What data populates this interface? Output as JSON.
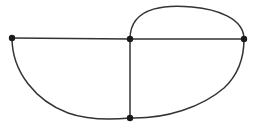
{
  "figure": {
    "background_color": "#ffffff",
    "edge_color": "#333333",
    "vertex_color": "#1a1a1a",
    "edge_stroke_width": 1.5,
    "vertex_radius": 3.2,
    "canvas": {
      "width": 254,
      "height": 126
    },
    "vertices": [
      {
        "id": "v-left",
        "label": "",
        "x": 12,
        "y": 38
      },
      {
        "id": "v-center",
        "label": "",
        "x": 130,
        "y": 39
      },
      {
        "id": "v-right",
        "label": "",
        "x": 244,
        "y": 39
      },
      {
        "id": "v-bottom",
        "label": "",
        "x": 130,
        "y": 118
      }
    ],
    "edges": [
      {
        "id": "edge-left-center-straight",
        "from": "v-left",
        "to": "v-center",
        "shape": "straight",
        "path": "M 12 38 L 130 39"
      },
      {
        "id": "edge-center-right-straight",
        "from": "v-center",
        "to": "v-right",
        "shape": "straight",
        "path": "M 130 39 L 244 39"
      },
      {
        "id": "edge-center-bottom-straight",
        "from": "v-center",
        "to": "v-bottom",
        "shape": "straight",
        "path": "M 130 39 L 130 118"
      },
      {
        "id": "edge-center-right-arc-top",
        "from": "v-center",
        "to": "v-right",
        "shape": "arc-above",
        "path": "M 130 39 C 130 4 172 5 192 7 C 216 9 244 18 244 39"
      },
      {
        "id": "edge-left-bottom-arc",
        "from": "v-left",
        "to": "v-bottom",
        "shape": "arc-below",
        "path": "M 12 38 C 12 72 36 101 68 113 C 88 120 110 120 130 118"
      },
      {
        "id": "edge-bottom-right-arc",
        "from": "v-bottom",
        "to": "v-right",
        "shape": "arc-below",
        "path": "M 130 118 C 166 119 202 107 224 88 C 238 75 244 58 244 39"
      }
    ]
  }
}
